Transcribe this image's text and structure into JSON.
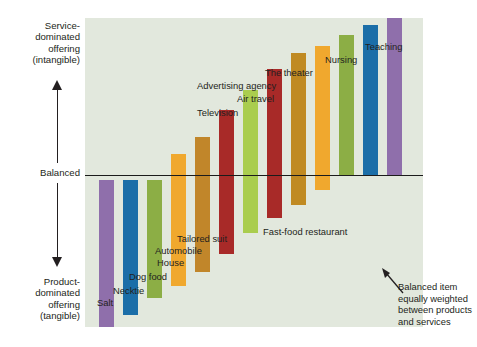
{
  "axis": {
    "top_label": "Service-\ndominated\noffering\n(intangible)",
    "top_label_line1": "Service-",
    "top_label_line2": "dominated",
    "top_label_line3": "offering",
    "top_label_line4": "(intangible)",
    "mid_label": "Balanced",
    "bottom_label_line1": "Product-",
    "bottom_label_line2": "dominated",
    "bottom_label_line3": "offering",
    "bottom_label_line4": "(tangible)",
    "up_arrow_icon": "up-arrow-icon",
    "down_arrow_icon": "down-arrow-icon"
  },
  "annotation": {
    "line1": "Balanced item",
    "line2": "equally weighted",
    "line3": "between products",
    "line4": "and services",
    "pointer_icon": "callout-arrow-icon"
  },
  "colors": {
    "panel_background": "#e2e8dd",
    "baseline": "#1b1b1b",
    "text": "#231f20",
    "purple": "#8f6fab",
    "blue": "#1b6ea8",
    "olive": "#8cae45",
    "amber": "#f0a82e",
    "ochre": "#c1862a",
    "crimson": "#a82a28",
    "lime": "#aacd4e",
    "gold": "#c08a22"
  },
  "chart_data": {
    "type": "bar",
    "title": "",
    "subtitle": "",
    "xlabel": "",
    "ylabel": "Service-dominated offering (intangible) / Balanced / Product-dominated offering (tangible)",
    "ylim": [
      -100,
      100
    ],
    "grid": false,
    "legend": "none",
    "baseline_value": 0,
    "note": "Diverging bar chart. Bars are drawn as spans; value is the midpoint position relative to the Balanced axis (0). Negative = product-dominated, positive = service-dominated.",
    "categories": [
      "Salt",
      "Necktie",
      "Dog food",
      "House",
      "Automobile",
      "Tailored suit",
      "Fast-food restaurant",
      "Television",
      "Air travel",
      "Advertising agency",
      "The theater",
      "Nursing",
      "Teaching"
    ],
    "values": [
      -62,
      -58,
      -50,
      -38,
      -30,
      -21,
      -12,
      -4,
      4,
      14,
      24,
      34,
      44
    ],
    "bar_spans": [
      {
        "label": "Salt",
        "top": -3,
        "bottom": -100,
        "color": "#8f6fab"
      },
      {
        "label": "Necktie",
        "top": -3,
        "bottom": -92,
        "color": "#1b6ea8"
      },
      {
        "label": "Dog food",
        "top": -3,
        "bottom": -81,
        "color": "#8cae45"
      },
      {
        "label": "House",
        "top": 14,
        "bottom": -73,
        "color": "#f0a82e"
      },
      {
        "label": "Automobile",
        "top": 25,
        "bottom": -64,
        "color": "#c1862a"
      },
      {
        "label": "Tailored suit",
        "top": 43,
        "bottom": -52,
        "color": "#a82a28"
      },
      {
        "label": "Fast-food restaurant",
        "top": 56,
        "bottom": -38,
        "color": "#aacd4e"
      },
      {
        "label": "Television",
        "top": 70,
        "bottom": -28,
        "color": "#a82a28"
      },
      {
        "label": "Air travel",
        "top": 80,
        "bottom": -20,
        "color": "#c08a22"
      },
      {
        "label": "Advertising agency",
        "top": 85,
        "bottom": -10,
        "color": "#f0a82e"
      },
      {
        "label": "The theater",
        "top": 92,
        "bottom": 0,
        "color": "#8cae45"
      },
      {
        "label": "Nursing",
        "top": 99,
        "bottom": 0,
        "color": "#1b6ea8"
      },
      {
        "label": "Teaching",
        "top": 106,
        "bottom": 0,
        "color": "#8f6fab"
      }
    ]
  }
}
